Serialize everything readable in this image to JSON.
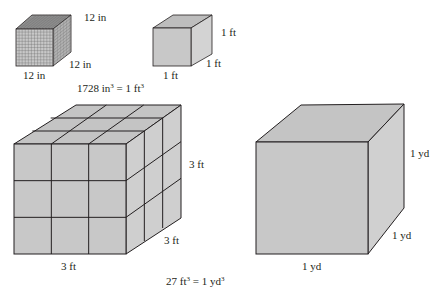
{
  "figure": {
    "colors": {
      "face_front": "#c8c8c8",
      "face_top": "#bdbdbd",
      "face_side": "#d3d3d3",
      "edge": "#231f20",
      "grid": "#7a7a7a"
    },
    "inch_cube": {
      "top_label": "12 in",
      "right_label": "12 in",
      "bottom_label": "12 in",
      "grid_divisions": 12
    },
    "foot_cube": {
      "right_label": "1 ft",
      "depth_label": "1 ft",
      "bottom_label": "1 ft"
    },
    "equation_top": {
      "left": "1728 in",
      "exp1": "3",
      "mid": " = 1 ft",
      "exp2": "3"
    },
    "three_foot_cube": {
      "right_label": "3 ft",
      "depth_label": "3 ft",
      "bottom_label": "3 ft",
      "grid_divisions": 3
    },
    "yard_cube": {
      "right_label": "1 yd",
      "depth_label": "1 yd",
      "bottom_label": "1 yd"
    },
    "equation_bottom": {
      "left": "27 ft",
      "exp1": "3",
      "mid": " = 1 yd",
      "exp2": "3"
    }
  }
}
